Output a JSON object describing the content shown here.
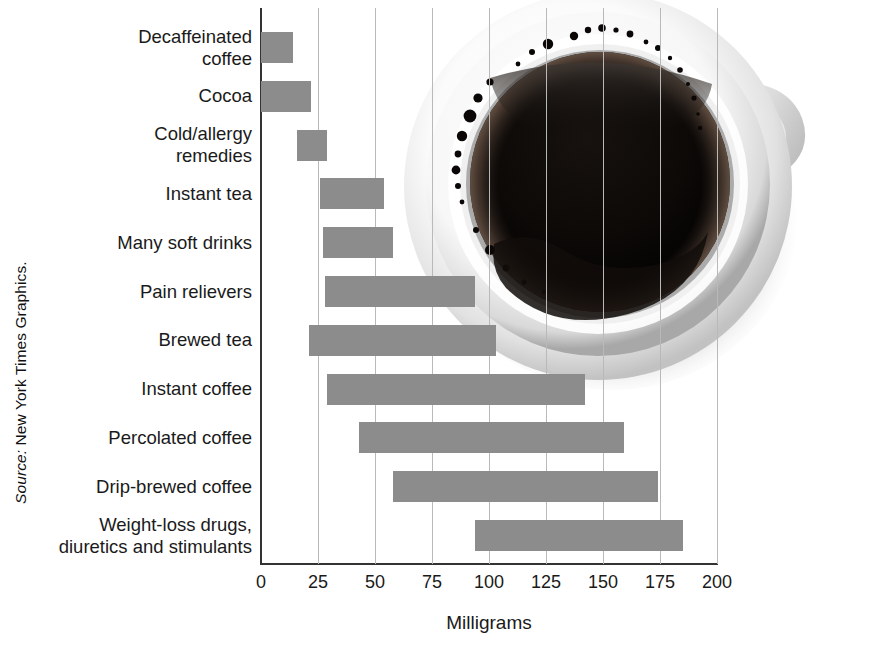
{
  "source_credit": {
    "prefix": "Source:",
    "text": " New York Times Graphics."
  },
  "photo": {
    "name": "coffee-cup-photo",
    "description": "overhead photo of a white cup of black coffee"
  },
  "chart_data": {
    "type": "bar",
    "orientation": "horizontal",
    "subtype": "range-bar",
    "title": "",
    "xlabel": "Milligrams",
    "ylabel": "",
    "xlim": [
      0,
      200
    ],
    "xticks": [
      0,
      25,
      50,
      75,
      100,
      125,
      150,
      175,
      200
    ],
    "xtick_labels": [
      "0",
      "25",
      "50",
      "75",
      "100",
      "125",
      "150",
      "175",
      "200"
    ],
    "grid": "vertical",
    "legend": "none",
    "bar_color": "#8c8c8c",
    "categories": [
      "Decaffeinated\ncoffee",
      "Cocoa",
      "Cold/allergy\nremedies",
      "Instant tea",
      "Many soft drinks",
      "Pain relievers",
      "Brewed tea",
      "Instant coffee",
      "Percolated coffee",
      "Drip-brewed coffee",
      "Weight-loss drugs,\ndiuretics and stimulants"
    ],
    "ranges": [
      {
        "category": "Decaffeinated coffee",
        "low": 0,
        "high": 14
      },
      {
        "category": "Cocoa",
        "low": 0,
        "high": 22
      },
      {
        "category": "Cold/allergy remedies",
        "low": 16,
        "high": 29
      },
      {
        "category": "Instant tea",
        "low": 26,
        "high": 54
      },
      {
        "category": "Many soft drinks",
        "low": 27,
        "high": 58
      },
      {
        "category": "Pain relievers",
        "low": 28,
        "high": 94
      },
      {
        "category": "Brewed tea",
        "low": 21,
        "high": 103
      },
      {
        "category": "Instant coffee",
        "low": 29,
        "high": 142
      },
      {
        "category": "Percolated coffee",
        "low": 43,
        "high": 159
      },
      {
        "category": "Drip-brewed coffee",
        "low": 58,
        "high": 174
      },
      {
        "category": "Weight-loss drugs, diuretics and stimulants",
        "low": 94,
        "high": 185
      }
    ]
  }
}
